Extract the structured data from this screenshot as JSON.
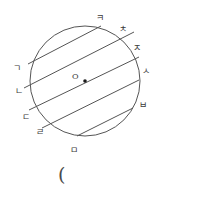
{
  "figure": {
    "type": "geometry-diagram",
    "stroke_color": "#555555",
    "background_color": "#ffffff",
    "circle": {
      "center_x": 85,
      "center_y": 81,
      "radius": 55,
      "center_dot_label": "O"
    },
    "chords": [
      {
        "x1": 28,
        "y1": 64,
        "x2": 101,
        "y2": 26
      },
      {
        "x1": 24,
        "y1": 88,
        "x2": 134,
        "y2": 32
      },
      {
        "x1": 29,
        "y1": 110,
        "x2": 139,
        "y2": 57
      },
      {
        "x1": 42,
        "y1": 128,
        "x2": 139,
        "y2": 80
      },
      {
        "x1": 77,
        "y1": 136,
        "x2": 133,
        "y2": 108
      }
    ],
    "point_labels": [
      {
        "text": "ㅋ",
        "x": 96,
        "y": 14,
        "name": "label-kieuk"
      },
      {
        "text": "ㅊ",
        "x": 119,
        "y": 25,
        "name": "label-chieut"
      },
      {
        "text": "ㅈ",
        "x": 133,
        "y": 44,
        "name": "label-jieut"
      },
      {
        "text": "ㅅ",
        "x": 142,
        "y": 67,
        "name": "label-siot"
      },
      {
        "text": "ㅂ",
        "x": 139,
        "y": 101,
        "name": "label-bieup"
      },
      {
        "text": "ㅁ",
        "x": 70,
        "y": 146,
        "name": "label-mieum"
      },
      {
        "text": "ㄹ",
        "x": 36,
        "y": 128,
        "name": "label-rieul"
      },
      {
        "text": "ㄷ",
        "x": 22,
        "y": 113,
        "name": "label-digeut"
      },
      {
        "text": "ㄴ",
        "x": 15,
        "y": 87,
        "name": "label-nieun"
      },
      {
        "text": "ㄱ",
        "x": 13,
        "y": 64,
        "name": "label-giyeok"
      }
    ],
    "center_label": {
      "text": "O",
      "x": 72,
      "y": 73
    },
    "caption": {
      "text": "(",
      "x": 58,
      "y": 165
    }
  }
}
